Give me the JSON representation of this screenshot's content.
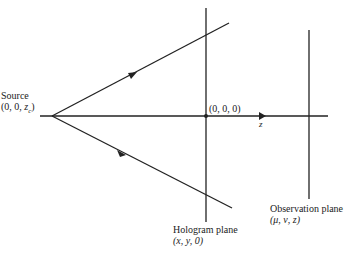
{
  "diagram": {
    "type": "optical-geometry",
    "source": {
      "title": "Source",
      "coords_prefix": "(0, 0, ",
      "coords_var": "z",
      "coords_sub": "c",
      "coords_suffix": ")"
    },
    "origin": {
      "label": "(0, 0, 0)"
    },
    "axis": {
      "label": "z"
    },
    "hologram_plane": {
      "title": "Hologram plane",
      "coords": "(x, y, 0)"
    },
    "observation_plane": {
      "title": "Observation plane",
      "coords": "(μ, ν, z)"
    },
    "colors": {
      "line": "#222222",
      "background": "#ffffff"
    }
  }
}
